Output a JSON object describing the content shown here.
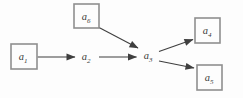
{
  "diagram": {
    "type": "directed-graph",
    "nodes": {
      "a1": {
        "base": "a",
        "sub": "1",
        "shape": "box"
      },
      "a2": {
        "base": "a",
        "sub": "2",
        "shape": "plain"
      },
      "a3": {
        "base": "a",
        "sub": "3",
        "shape": "plain"
      },
      "a4": {
        "base": "a",
        "sub": "4",
        "shape": "box"
      },
      "a5": {
        "base": "a",
        "sub": "5",
        "shape": "box"
      },
      "a6": {
        "base": "a",
        "sub": "6",
        "shape": "box"
      }
    },
    "edges": [
      {
        "from": "a1",
        "to": "a2"
      },
      {
        "from": "a2",
        "to": "a3"
      },
      {
        "from": "a6",
        "to": "a3"
      },
      {
        "from": "a3",
        "to": "a4"
      },
      {
        "from": "a3",
        "to": "a5"
      }
    ],
    "colors": {
      "box_border": "#8f8f8f",
      "edge": "#3f3f3f",
      "text": "#3a3a3a",
      "background": "#fdfdfd"
    }
  }
}
